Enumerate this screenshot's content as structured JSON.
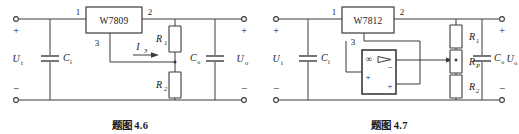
{
  "figures": [
    {
      "id": "fig-4-6",
      "caption_label": "题图",
      "caption_number": "4.6",
      "regulator": {
        "name": "W7809",
        "pins": {
          "input": "1",
          "output": "2",
          "ground": "3"
        }
      },
      "labels": {
        "input_voltage": "U",
        "input_voltage_sub": "i",
        "output_voltage": "U",
        "output_voltage_sub": "o",
        "input_cap": "C",
        "input_cap_sub": "i",
        "output_cap": "C",
        "output_cap_sub": "o",
        "resistor_top": "R",
        "resistor_top_sub": "1",
        "resistor_bottom": "R",
        "resistor_bottom_sub": "2",
        "current": "I",
        "current_sub": "3",
        "plus_in": "+",
        "minus_in": "−",
        "plus_out": "+",
        "minus_out": "−"
      }
    },
    {
      "id": "fig-4-7",
      "caption_label": "题图",
      "caption_number": "4.7",
      "regulator": {
        "name": "W7812",
        "pins": {
          "input": "1",
          "output": "2",
          "ground": "3"
        }
      },
      "opamp": {
        "gain_symbol": "∞",
        "inverting_input": "−",
        "noninverting_input": "+",
        "output_plus": "+"
      },
      "labels": {
        "input_voltage": "U",
        "input_voltage_sub": "i",
        "output_voltage": "U",
        "output_voltage_sub": "o",
        "input_cap": "C",
        "input_cap_sub": "i",
        "output_cap": "C",
        "output_cap_sub": "o",
        "resistor_top": "R",
        "resistor_top_sub": "1",
        "potentiometer": "R",
        "potentiometer_sub": "P",
        "resistor_bottom": "R",
        "resistor_bottom_sub": "2",
        "plus_in": "+",
        "minus_in": "−",
        "plus_out": "+",
        "minus_out": "−"
      }
    }
  ],
  "colors": {
    "line": "#3a3a3a",
    "text": "#1a1a1a",
    "background": "#ffffff"
  }
}
